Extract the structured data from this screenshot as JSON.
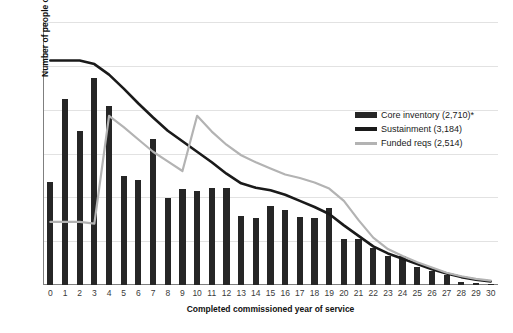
{
  "chart_data": {
    "type": "bar",
    "title": "",
    "xlabel": "Completed commissioned year of service",
    "ylabel": "Number of people or positions",
    "ylim": [
      0,
      300
    ],
    "yticks": [
      0,
      50,
      100,
      150,
      200,
      250,
      300
    ],
    "grid": true,
    "legend_position": "right-upper",
    "categories": [
      "0",
      "1",
      "2",
      "3",
      "4",
      "5",
      "6",
      "7",
      "8",
      "9",
      "10",
      "11",
      "12",
      "13",
      "14",
      "15",
      "16",
      "17",
      "18",
      "19",
      "20",
      "21",
      "22",
      "23",
      "24",
      "25",
      "26",
      "27",
      "28",
      "29",
      "30"
    ],
    "series": [
      {
        "name": "Core inventory (2,710)*",
        "type": "bar",
        "color": "#262626",
        "values": [
          117,
          212,
          176,
          236,
          204,
          124,
          120,
          167,
          99,
          109,
          107,
          111,
          111,
          79,
          76,
          90,
          85,
          78,
          76,
          88,
          52,
          52,
          42,
          33,
          33,
          20,
          16,
          11,
          4,
          2,
          1
        ]
      },
      {
        "name": "Sustainment (3,184)",
        "type": "line",
        "color": "#1a1a1a",
        "values": [
          256,
          256,
          256,
          252,
          240,
          224,
          207,
          191,
          176,
          164,
          152,
          140,
          127,
          116,
          111,
          108,
          103,
          96,
          89,
          81,
          68,
          56,
          44,
          36,
          30,
          24,
          18,
          13,
          9,
          6,
          4
        ]
      },
      {
        "name": "Funded reqs (2,514)",
        "type": "line",
        "color": "#b3b3b3",
        "values": [
          72,
          72,
          72,
          70,
          193,
          180,
          166,
          152,
          141,
          130,
          193,
          175,
          160,
          148,
          140,
          133,
          126,
          122,
          117,
          110,
          96,
          74,
          54,
          41,
          33,
          26,
          20,
          14,
          10,
          7,
          5
        ]
      }
    ]
  },
  "legend": {
    "items": [
      {
        "label": "Core inventory (2,710)*",
        "swatch": "core-swatch"
      },
      {
        "label": "Sustainment (3,184)",
        "swatch": "sustainment-swatch"
      },
      {
        "label": "Funded reqs (2,514)",
        "swatch": "funded-reqs-swatch"
      }
    ]
  }
}
